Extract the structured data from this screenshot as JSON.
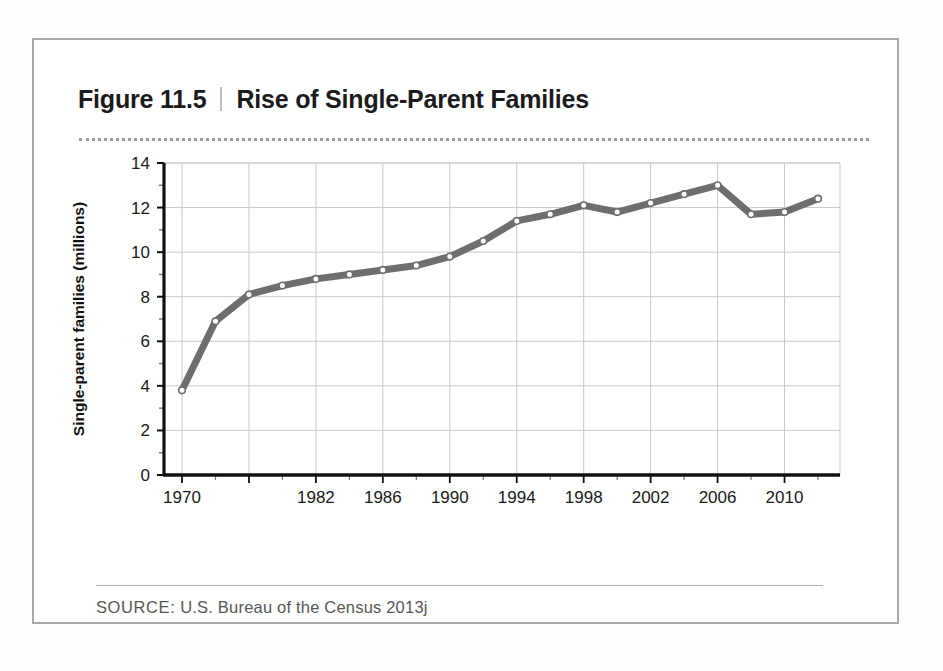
{
  "figure": {
    "number": "Figure 11.5",
    "divider": "|",
    "title": "Rise of Single-Parent Families",
    "source_label": "SOURCE:",
    "source_text": "U.S. Bureau of the Census 2013j"
  },
  "colors": {
    "line": "#6e6e6e",
    "marker_fill": "#ffffff",
    "marker_stroke": "#6e6e6e",
    "grid": "#c9c9c9",
    "axis": "#111111",
    "frame": "#a8a8a8",
    "rule": "#9d9d9d"
  },
  "chart_data": {
    "type": "line",
    "title": "Rise of Single-Parent Families",
    "xlabel": "",
    "ylabel": "Single-parent families (millions)",
    "ylim": [
      0,
      14
    ],
    "xlim": [
      1970,
      2012
    ],
    "grid": true,
    "legend": "none",
    "ytick_labels": [
      "0",
      "2",
      "4",
      "6",
      "8",
      "10",
      "12",
      "14"
    ],
    "ytick_values": [
      0,
      2,
      4,
      6,
      8,
      10,
      12,
      14
    ],
    "xtick_labels": [
      "1970",
      "1982",
      "1986",
      "1990",
      "1994",
      "1998",
      "2002",
      "2006",
      "2010"
    ],
    "xtick_values": [
      1970,
      1982,
      1986,
      1990,
      1994,
      1998,
      2002,
      2006,
      2010
    ],
    "x": [
      1970,
      1972,
      1976,
      1980,
      1982,
      1984,
      1986,
      1988,
      1990,
      1992,
      1994,
      1996,
      1998,
      2000,
      2002,
      2004,
      2006,
      2008,
      2010,
      2012
    ],
    "values": [
      3.8,
      6.9,
      8.1,
      8.5,
      8.8,
      9.0,
      9.2,
      9.4,
      9.8,
      10.5,
      11.4,
      11.7,
      12.1,
      11.8,
      12.2,
      12.6,
      13.0,
      11.7,
      11.8,
      12.4
    ],
    "series": [
      {
        "name": "Single-parent families",
        "values": [
          3.8,
          6.9,
          8.1,
          8.5,
          8.8,
          9.0,
          9.2,
          9.4,
          9.8,
          10.5,
          11.4,
          11.7,
          12.1,
          11.8,
          12.2,
          12.6,
          13.0,
          11.7,
          11.8,
          12.4
        ]
      }
    ]
  }
}
